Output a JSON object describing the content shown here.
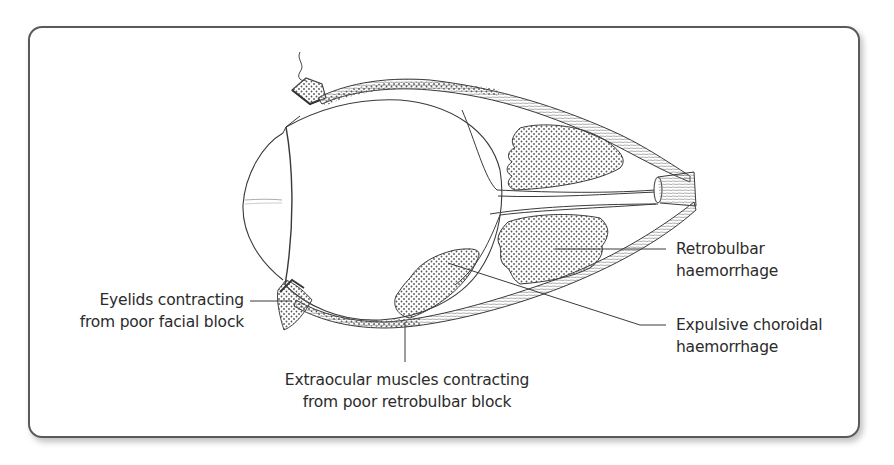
{
  "figure": {
    "type": "anatomical-diagram",
    "colors": {
      "frame_border": "#5a5a5a",
      "line": "#3a3a3a",
      "stipple": "#555555",
      "text": "#2b2b2b",
      "background": "#ffffff"
    }
  },
  "labels": {
    "eyelids": {
      "line1": "Eyelids contracting",
      "line2": "from poor facial block"
    },
    "extraocular": {
      "line1": "Extraocular muscles contracting",
      "line2": "from poor retrobulbar block"
    },
    "retrobulbar": {
      "line1": "Retrobulbar",
      "line2": "haemorrhage"
    },
    "choroidal": {
      "line1": "Expulsive choroidal",
      "line2": "haemorrhage"
    }
  }
}
